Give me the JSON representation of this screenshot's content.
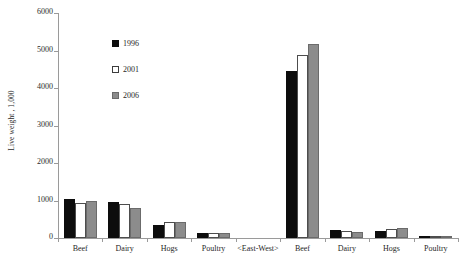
{
  "chart_data": {
    "type": "bar",
    "title": "",
    "xlabel": "",
    "ylabel": "Live weight , 1,000",
    "ylim": [
      0,
      6000
    ],
    "yticks": [
      0,
      1000,
      2000,
      3000,
      4000,
      5000,
      6000
    ],
    "ytick_labels": [
      "0",
      "1000",
      "2000",
      "3000",
      "4000",
      "5000",
      "6000"
    ],
    "grid": false,
    "legend_position": "upper-left-inside",
    "categories": [
      "Beef",
      "Dairy",
      "Hogs",
      "Poultry",
      "<East-West>",
      "Beef",
      "Dairy",
      "Hogs",
      "Poultry"
    ],
    "series": [
      {
        "name": "1996",
        "color": "#0d0d0d",
        "values": [
          1050,
          960,
          350,
          130,
          null,
          4450,
          210,
          200,
          45
        ]
      },
      {
        "name": "2001",
        "color": "#ffffff",
        "values": [
          930,
          900,
          440,
          130,
          null,
          4870,
          190,
          230,
          30
        ]
      },
      {
        "name": "2006",
        "color": "#8c8c8c",
        "values": [
          990,
          810,
          440,
          130,
          null,
          5170,
          160,
          270,
          40
        ]
      }
    ]
  },
  "legend": {
    "items": [
      {
        "label": "1996"
      },
      {
        "label": "2001"
      },
      {
        "label": "2006"
      }
    ]
  }
}
